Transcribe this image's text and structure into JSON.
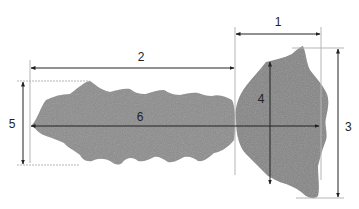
{
  "diagram": {
    "type": "specimen measurement schematic",
    "colors": {
      "background": "#ffffff",
      "specimen": "#8a8a8a",
      "specimen_shade": "#7a7a7a",
      "dimension_line": "#222222",
      "extension_line": "#b5b5b5"
    },
    "measurements": [
      {
        "id": "1",
        "label": "1",
        "orientation": "horizontal",
        "description": "width of the head part"
      },
      {
        "id": "2",
        "label": "2",
        "orientation": "horizontal",
        "description": "length of the elongated body"
      },
      {
        "id": "3",
        "label": "3",
        "orientation": "vertical",
        "description": "total height of the head part"
      },
      {
        "id": "4",
        "label": "4",
        "orientation": "vertical",
        "description": "inner height of the head part"
      },
      {
        "id": "5",
        "label": "5",
        "orientation": "vertical",
        "description": "height of the elongated body"
      },
      {
        "id": "6",
        "label": "6",
        "orientation": "horizontal",
        "description": "total axial length"
      }
    ]
  }
}
